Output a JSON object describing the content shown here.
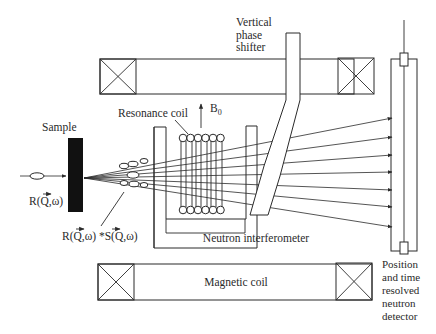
{
  "labels": {
    "sample": "Sample",
    "resonance_coil": "Resonance coil",
    "b0_main": "B",
    "b0_sub": "0",
    "vertical_phase_shifter": [
      "Vertical",
      "phase",
      "shifter"
    ],
    "incident_function": {
      "prefix": "R(",
      "q": "Q",
      "suffix": ",ω)"
    },
    "scattered_function": {
      "part1": "R(",
      "q1": "Q",
      "mid": ",ω) *S(",
      "q2": "Q",
      "suffix": ",ω)"
    },
    "neutron_interferometer": "Neutron interferometer",
    "magnetic_coil": "Magnetic coil",
    "detector": [
      "Position",
      "and time",
      "resolved",
      "neutron",
      "detector"
    ]
  },
  "beams": {
    "origin": [
      84,
      178
    ],
    "targets_y": [
      118,
      137,
      155,
      172,
      190,
      207,
      227
    ],
    "target_x": 392
  },
  "colors": {
    "ink": "#2a2a2a",
    "sample": "#111111",
    "background": "#ffffff"
  }
}
